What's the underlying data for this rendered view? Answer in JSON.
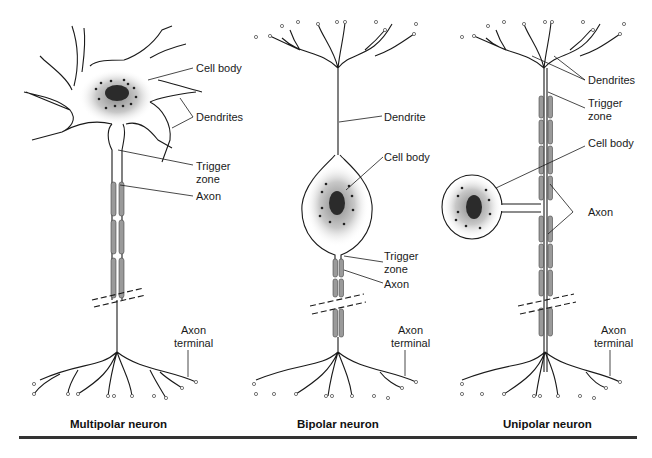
{
  "figure": {
    "panels": [
      {
        "caption": "Multipolar neuron",
        "labels": {
          "cell_body": "Cell body",
          "dendrites": "Dendrites",
          "trigger_zone": "Trigger\nzone",
          "axon": "Axon",
          "axon_terminal": "Axon\nterminal"
        }
      },
      {
        "caption": "Bipolar neuron",
        "labels": {
          "dendrite": "Dendrite",
          "cell_body": "Cell body",
          "trigger_zone": "Trigger\nzone",
          "axon": "Axon",
          "axon_terminal": "Axon\nterminal"
        }
      },
      {
        "caption": "Unipolar neuron",
        "labels": {
          "dendrites": "Dendrites",
          "trigger_zone": "Trigger\nzone",
          "cell_body": "Cell body",
          "axon": "Axon",
          "axon_terminal": "Axon\nterminal"
        }
      }
    ],
    "colors": {
      "line": "#1a1a1a",
      "myelin": "#9a9a9a",
      "nucleus": "#2b2b2b",
      "rule": "#333333"
    }
  }
}
